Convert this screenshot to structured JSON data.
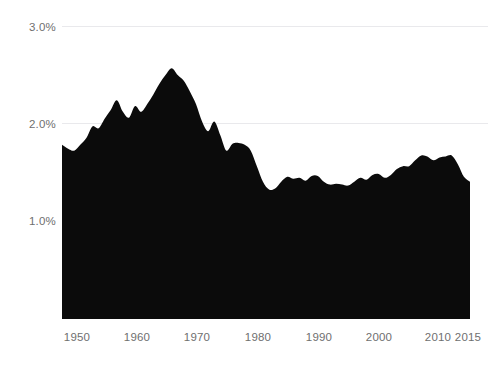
{
  "chart_data": {
    "type": "area",
    "title": "",
    "subtitle": "",
    "xlabel": "",
    "ylabel": "",
    "xlim": [
      1948,
      2015
    ],
    "ylim": [
      0.0,
      3.0
    ],
    "grid": true,
    "gridlines_y": [
      2.0,
      3.0
    ],
    "legend": null,
    "legend_position": "none",
    "series_color": "#0b0b0b",
    "gridline_color": "#e9e9ec",
    "tick_color": "#6f6f6f",
    "y_ticks": [
      {
        "value": 1.0,
        "label": "1.0%"
      },
      {
        "value": 2.0,
        "label": "2.0%"
      },
      {
        "value": 3.0,
        "label": "3.0%"
      }
    ],
    "x_ticks": [
      {
        "value": 1950,
        "label": "1950"
      },
      {
        "value": 1960,
        "label": "1960"
      },
      {
        "value": 1970,
        "label": "1970"
      },
      {
        "value": 1980,
        "label": "1980"
      },
      {
        "value": 1990,
        "label": "1990"
      },
      {
        "value": 2000,
        "label": "2000"
      },
      {
        "value": 2010,
        "label": "2010"
      },
      {
        "value": 2015,
        "label": "2015"
      }
    ],
    "x": [
      1948,
      1949,
      1950,
      1951,
      1952,
      1953,
      1954,
      1955,
      1956,
      1957,
      1958,
      1959,
      1960,
      1961,
      1962,
      1963,
      1964,
      1965,
      1966,
      1967,
      1968,
      1969,
      1970,
      1971,
      1972,
      1973,
      1974,
      1975,
      1976,
      1977,
      1978,
      1979,
      1980,
      1981,
      1982,
      1983,
      1984,
      1985,
      1986,
      1987,
      1988,
      1989,
      1990,
      1991,
      1992,
      1993,
      1994,
      1995,
      1996,
      1997,
      1998,
      1999,
      2000,
      2001,
      2002,
      2003,
      2004,
      2005,
      2006,
      2007,
      2008,
      2009,
      2010,
      2011,
      2012,
      2013,
      2014,
      2015
    ],
    "values": [
      1.78,
      1.74,
      1.72,
      1.78,
      1.85,
      1.97,
      1.95,
      2.05,
      2.14,
      2.24,
      2.12,
      2.06,
      2.18,
      2.12,
      2.2,
      2.3,
      2.41,
      2.5,
      2.57,
      2.5,
      2.44,
      2.33,
      2.2,
      2.02,
      1.92,
      2.02,
      1.88,
      1.72,
      1.79,
      1.8,
      1.78,
      1.72,
      1.56,
      1.4,
      1.32,
      1.33,
      1.4,
      1.45,
      1.43,
      1.44,
      1.41,
      1.46,
      1.46,
      1.4,
      1.37,
      1.38,
      1.37,
      1.36,
      1.4,
      1.44,
      1.42,
      1.47,
      1.48,
      1.44,
      1.47,
      1.53,
      1.56,
      1.56,
      1.62,
      1.67,
      1.66,
      1.62,
      1.65,
      1.66,
      1.67,
      1.58,
      1.45,
      1.4
    ],
    "units": "percent",
    "value_format": "0.0%",
    "x_axis_range_note": "",
    "y_axis_tick_suffix": "%"
  },
  "axis": {
    "y_tick_labels": [
      "3.0%",
      "2.0%",
      "1.0%"
    ],
    "x_tick_labels": [
      "1950",
      "1960",
      "1970",
      "1980",
      "1990",
      "2000",
      "2010",
      "2015"
    ]
  }
}
